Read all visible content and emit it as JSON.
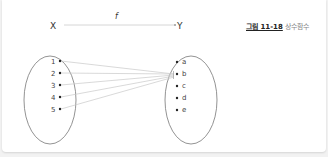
{
  "figure": {
    "caption_number": "그림 11-18",
    "caption_title": "상수함수",
    "function_label": "f",
    "domain_label": "X",
    "codomain_label": "Y",
    "domain_elements": [
      "1",
      "2",
      "3",
      "4",
      "5"
    ],
    "codomain_elements": [
      "a",
      "b",
      "c",
      "d",
      "e"
    ],
    "mapping_target": "b",
    "colors": {
      "lines": "#bdbdbd",
      "ellipse": "#777777",
      "text": "#333333"
    }
  }
}
